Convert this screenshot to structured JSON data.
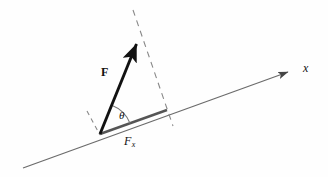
{
  "figure": {
    "background_color": "#fefefe",
    "width": 328,
    "height": 177,
    "labels": {
      "force_vector": "F",
      "axis": "x",
      "angle": "θ",
      "component_base": "F",
      "component_subscript": "x"
    },
    "colors": {
      "vector_stroke": "#111111",
      "axis_stroke": "#6b6b6b",
      "component_stroke": "#555555",
      "dashed_stroke": "#808080",
      "arc_stroke": "#777777",
      "text": "#111111"
    },
    "geometry": {
      "origin": {
        "x": 100,
        "y": 134
      },
      "force_tip": {
        "x": 139,
        "y": 36
      },
      "axis_start": {
        "x": 23,
        "y": 168
      },
      "axis_end": {
        "x": 293,
        "y": 70
      },
      "component_end": {
        "x": 167,
        "y": 110
      },
      "dashed_projection_start": {
        "x": 133,
        "y": 10
      },
      "dashed_projection_end": {
        "x": 173,
        "y": 126
      },
      "dashed_normal_start": {
        "x": 87,
        "y": 111
      },
      "dashed_normal_end": {
        "x": 100,
        "y": 135
      },
      "arc_radius": 31,
      "angle_degrees": 48
    },
    "label_positions": {
      "force": {
        "x": 101,
        "y": 66
      },
      "axis": {
        "x": 303,
        "y": 62
      },
      "theta": {
        "x": 119,
        "y": 110
      },
      "component": {
        "x": 124,
        "y": 135
      }
    }
  }
}
